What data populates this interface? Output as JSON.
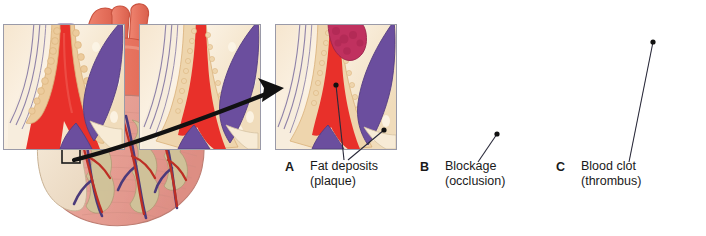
{
  "figure": {
    "arrow": {
      "name": "callout-arrow",
      "from": "heart-detail-box",
      "to": "panel-a"
    }
  },
  "heart": {
    "name": "heart-illustration",
    "parts": [
      {
        "name": "aorta",
        "color": "#e8715c"
      },
      {
        "name": "pulmonary-trunk",
        "color": "#e8715c"
      },
      {
        "name": "superior-vena-cava",
        "color": "#8d7ab8"
      },
      {
        "name": "pulmonary-veins",
        "color": "#8d7ab8"
      },
      {
        "name": "left-atrial-appendage",
        "color": "#f2e2cd"
      },
      {
        "name": "right-ventricle",
        "color": "#e8a79c"
      },
      {
        "name": "left-ventricle",
        "color": "#e5a096"
      },
      {
        "name": "coronary-artery",
        "color": "#c0392b"
      },
      {
        "name": "coronary-vein",
        "color": "#4b3a7a"
      },
      {
        "name": "epicardial-fat",
        "color": "#cfc49a"
      }
    ],
    "detail_box": {
      "name": "detail-box",
      "x": 62,
      "y": 147,
      "w": 18,
      "h": 16
    }
  },
  "panels": [
    {
      "id": "panel-a",
      "letter": "A",
      "label_line1": "Fat deposits",
      "label_line2": "(plaque)",
      "caption": "Fat deposits (plaque)",
      "lumen_color": "#e8302a",
      "plaque_color": "#e8c79a",
      "vein_color": "#6b4e9e",
      "tissue_color": "#f7e9d2",
      "wall_color": "#8f82a8",
      "pointers": 2
    },
    {
      "id": "panel-b",
      "letter": "B",
      "label_line1": "Blockage",
      "label_line2": "(occlusion)",
      "caption": "Blockage (occlusion)",
      "lumen_color": "#e8302a",
      "plaque_color": "#ecd2a6",
      "vein_color": "#6b4e9e",
      "tissue_color": "#f7e9d2",
      "wall_color": "#8f82a8",
      "pointers": 1
    },
    {
      "id": "panel-c",
      "letter": "C",
      "label_line1": "Blood clot",
      "label_line2": "(thrombus)",
      "caption": "Blood clot (thrombus)",
      "lumen_color": "#e8302a",
      "plaque_color": "#ecd2a6",
      "clot_color": "#c0315f",
      "vein_color": "#6b4e9e",
      "tissue_color": "#f7e9d2",
      "wall_color": "#8f82a8",
      "pointers": 1
    }
  ]
}
